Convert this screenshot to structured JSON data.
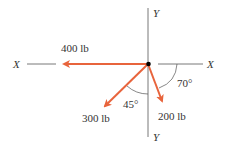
{
  "diagram": {
    "title": "",
    "axes": {
      "x_left_label": "X",
      "x_right_label": "X",
      "y_top_label": "Y",
      "y_bottom_label": "Y"
    },
    "forces": [
      {
        "label": "400 lb",
        "direction": "left along -X",
        "color": "#e8643c"
      },
      {
        "label": "300 lb",
        "direction": "down-left, 45° from -Y",
        "color": "#e8643c"
      },
      {
        "label": "200 lb",
        "direction": "down-right, 70° below +X",
        "color": "#e8643c"
      }
    ],
    "angles": [
      {
        "label": "45°"
      },
      {
        "label": "70°"
      }
    ],
    "colors": {
      "force": "#e8643c",
      "axis": "#555555",
      "origin": "#000000"
    }
  }
}
